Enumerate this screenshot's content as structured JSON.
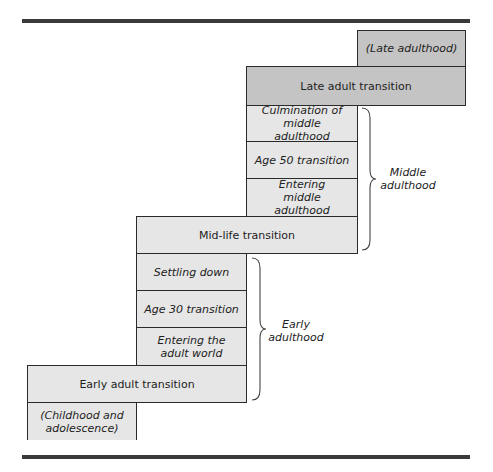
{
  "diagram": {
    "steps": [
      {
        "id": "late-adulthood",
        "label": "(Late adulthood)",
        "italic": true,
        "shade": "dark"
      },
      {
        "id": "late-adult-transition",
        "label": "Late adult transition",
        "italic": false,
        "shade": "dark"
      },
      {
        "id": "culmination-middle",
        "label": "Culmination of middle adulthood",
        "italic": true,
        "shade": "light"
      },
      {
        "id": "age-50-transition",
        "label": "Age 50 transition",
        "italic": true,
        "shade": "light"
      },
      {
        "id": "entering-middle",
        "label": "Entering middle adulthood",
        "italic": true,
        "shade": "light"
      },
      {
        "id": "mid-life-transition",
        "label": "Mid-life transition",
        "italic": false,
        "shade": "light"
      },
      {
        "id": "settling-down",
        "label": "Settling down",
        "italic": true,
        "shade": "light"
      },
      {
        "id": "age-30-transition",
        "label": "Age 30 transition",
        "italic": true,
        "shade": "light"
      },
      {
        "id": "entering-adult-world",
        "label": "Entering the adult world",
        "italic": true,
        "shade": "light"
      },
      {
        "id": "early-adult-transition",
        "label": "Early adult transition",
        "italic": false,
        "shade": "light"
      },
      {
        "id": "childhood",
        "label": "(Childhood and adolescence)",
        "italic": true,
        "shade": "light"
      }
    ],
    "brackets": [
      {
        "id": "middle-adulthood",
        "label": "Middle adulthood"
      },
      {
        "id": "early-adulthood",
        "label": "Early adulthood"
      }
    ],
    "colors": {
      "dark": "#c4c4c4",
      "light": "#e6e6e6",
      "rule": "#3a3a3a"
    }
  }
}
